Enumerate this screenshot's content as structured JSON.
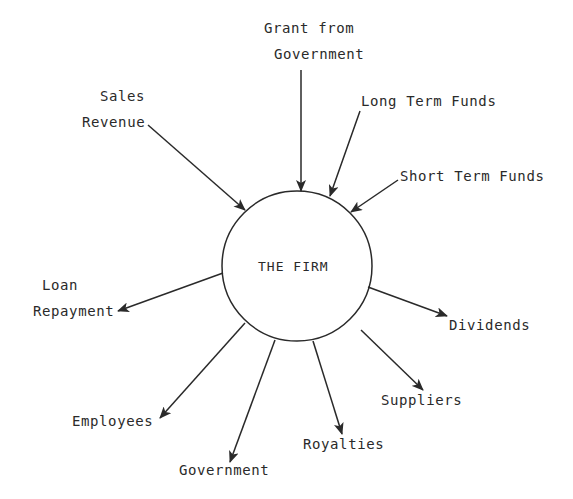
{
  "diagram": {
    "title": "",
    "center": {
      "label": "THE FIRM",
      "cx": 297,
      "cy": 266,
      "r": 75
    },
    "colors": {
      "stroke": "#2a2a2a",
      "text": "#2a2a2a",
      "background": "#ffffff"
    },
    "inflows": [
      {
        "id": "sales-revenue",
        "lines": [
          "Sales",
          "Revenue"
        ],
        "x1": 148,
        "y1": 125,
        "x2": 245,
        "y2": 210
      },
      {
        "id": "grant-from-government",
        "lines": [
          "Grant from",
          "Government"
        ],
        "x1": 301,
        "y1": 70,
        "x2": 301,
        "y2": 191
      },
      {
        "id": "long-term-funds",
        "lines": [
          "Long Term Funds"
        ],
        "x1": 360,
        "y1": 111,
        "x2": 330,
        "y2": 196
      },
      {
        "id": "short-term-funds",
        "lines": [
          "Short Term Funds"
        ],
        "x1": 398,
        "y1": 180,
        "x2": 351,
        "y2": 212
      }
    ],
    "outflows": [
      {
        "id": "loan-repayment",
        "lines": [
          "Loan",
          "Repayment"
        ],
        "x1": 223,
        "y1": 273,
        "x2": 118,
        "y2": 311
      },
      {
        "id": "dividends",
        "lines": [
          "Dividends"
        ],
        "x1": 368,
        "y1": 287,
        "x2": 447,
        "y2": 316
      },
      {
        "id": "suppliers",
        "lines": [
          "Suppliers"
        ],
        "x1": 361,
        "y1": 330,
        "x2": 423,
        "y2": 390
      },
      {
        "id": "royalties",
        "lines": [
          "Royalties"
        ],
        "x1": 313,
        "y1": 341,
        "x2": 342,
        "y2": 434
      },
      {
        "id": "government",
        "lines": [
          "Government"
        ],
        "x1": 275,
        "y1": 340,
        "x2": 230,
        "y2": 462
      },
      {
        "id": "employees",
        "lines": [
          "Employees"
        ],
        "x1": 245,
        "y1": 323,
        "x2": 160,
        "y2": 418
      }
    ],
    "labels": {
      "sales_1": "Sales",
      "sales_2": "Revenue",
      "grant_1": "Grant from",
      "grant_2": "Government",
      "long_term": "Long Term Funds",
      "short_term": "Short Term Funds",
      "loan_1": "Loan",
      "loan_2": "Repayment",
      "dividends": "Dividends",
      "suppliers": "Suppliers",
      "royalties": "Royalties",
      "government": "Government",
      "employees": "Employees",
      "center": "THE FIRM"
    }
  }
}
